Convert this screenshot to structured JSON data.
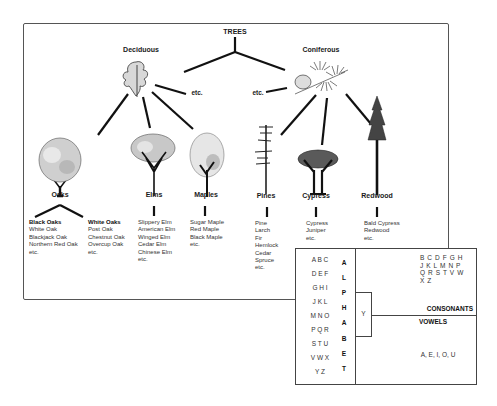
{
  "diagram": {
    "root": "TREES",
    "branches": [
      {
        "label": "Deciduous",
        "etc": "etc."
      },
      {
        "label": "Coniferous",
        "etc": "etc."
      }
    ],
    "trees": [
      {
        "label": "Oaks",
        "icon": "oak-tree-icon"
      },
      {
        "label": "Elms",
        "icon": "elm-tree-icon"
      },
      {
        "label": "Maples",
        "icon": "maple-tree-icon"
      },
      {
        "label": "Pines",
        "icon": "pine-tree-icon"
      },
      {
        "label": "Cypress",
        "icon": "cypress-tree-icon"
      },
      {
        "label": "Redwood",
        "icon": "redwood-tree-icon"
      }
    ],
    "lists": {
      "black_oaks": {
        "header": "Black Oaks",
        "items": [
          "White Oak",
          "Blackjack Oak",
          "Northern Red Oak",
          "etc."
        ]
      },
      "white_oaks": {
        "header": "White Oaks",
        "items": [
          "Post Oak",
          "Chestnut Oak",
          "Overcup Oak",
          "etc."
        ]
      },
      "elms": {
        "items": [
          "Slippery Elm",
          "American Elm",
          "Winged Elm",
          "Cedar Elm",
          "Chinese Elm",
          "etc."
        ]
      },
      "maples": {
        "items": [
          "Sugar Maple",
          "Red Maple",
          "Black Maple",
          "etc."
        ]
      },
      "pines": {
        "items": [
          "Pine",
          "Larch",
          "Fir",
          "Hemlock",
          "Cedar",
          "Spruce",
          "etc."
        ]
      },
      "cypress": {
        "items": [
          "Cypress",
          "Juniper",
          "etc."
        ]
      },
      "redwood": {
        "items": [
          "Bald Cypress",
          "Redwood",
          "etc."
        ]
      }
    }
  },
  "alphabet": {
    "letter_groups": [
      "A B C",
      "D E F",
      "G H I",
      "J K L",
      "M N O",
      "P Q R",
      "S T U",
      "V W X",
      "Y Z"
    ],
    "word_letters": [
      "A",
      "L",
      "P",
      "H",
      "A",
      "B",
      "E",
      "T"
    ],
    "y_label": "Y",
    "consonants_rows": [
      "B C D F G H",
      "J K L M N P",
      "Q R S T V W",
      "X Z"
    ],
    "consonants_label": "CONSONANTS",
    "vowels_label": "VOWELS",
    "vowels": "A, E, I, O, U"
  }
}
